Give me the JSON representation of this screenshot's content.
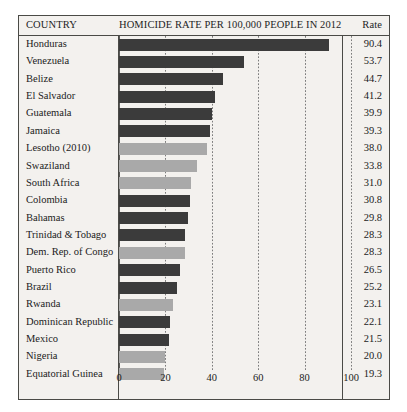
{
  "header": {
    "country_label": "COUNTRY",
    "main_label": "HOMICIDE RATE PER 100,000 PEOPLE IN 2012",
    "rate_label": "Rate"
  },
  "colors": {
    "bar_dark": "#3b3b3b",
    "bar_light": "#a9a9a9",
    "panel_background": "#f3f1ee",
    "frame_border": "#4a4a46",
    "text": "#1b1b1b"
  },
  "chart_data": {
    "type": "bar",
    "orientation": "horizontal",
    "title": "HOMICIDE RATE PER 100,000 PEOPLE IN 2012",
    "xlabel": "",
    "ylabel": "COUNTRY",
    "xlim": [
      0,
      100
    ],
    "xticks": [
      0,
      20,
      40,
      60,
      80,
      100
    ],
    "xtick_labels": [
      "0",
      "20",
      "40",
      "60",
      "80",
      "100"
    ],
    "grid": "vertical-dotted",
    "legend": "none",
    "value_column_header": "Rate",
    "categories": [
      "Honduras",
      "Venezuela",
      "Belize",
      "El Salvador",
      "Guatemala",
      "Jamaica",
      "Lesotho (2010)",
      "Swaziland",
      "South Africa",
      "Colombia",
      "Bahamas",
      "Trinidad & Tobago",
      "Dem. Rep. of Congo",
      "Puerto Rico",
      "Brazil",
      "Rwanda",
      "Dominican Republic",
      "Mexico",
      "Nigeria",
      "Equatorial Guinea"
    ],
    "values": [
      90.4,
      53.7,
      44.7,
      41.2,
      39.9,
      39.3,
      38.0,
      33.8,
      31.0,
      30.8,
      29.8,
      28.3,
      28.3,
      26.5,
      25.2,
      23.1,
      22.1,
      21.5,
      20.0,
      19.3
    ],
    "value_labels": [
      "90.4",
      "53.7",
      "44.7",
      "41.2",
      "39.9",
      "39.3",
      "38.0",
      "33.8",
      "31.0",
      "30.8",
      "29.8",
      "28.3",
      "28.3",
      "26.5",
      "25.2",
      "23.1",
      "22.1",
      "21.5",
      "20.0",
      "19.3"
    ],
    "bar_shades": [
      "dark",
      "dark",
      "dark",
      "dark",
      "dark",
      "dark",
      "light",
      "light",
      "light",
      "dark",
      "dark",
      "dark",
      "light",
      "dark",
      "dark",
      "light",
      "dark",
      "dark",
      "light",
      "light"
    ]
  }
}
